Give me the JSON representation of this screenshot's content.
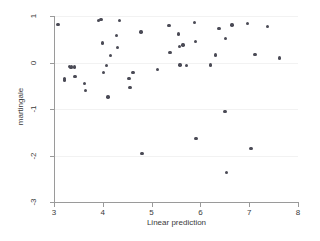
{
  "figure": {
    "background_color": "#ffffff",
    "marker_color": "#4a4a55",
    "axis_color": "#9a9a9a",
    "gridline_color": "#f2f2f2"
  },
  "chart_data": {
    "type": "scatter",
    "title": "",
    "xlabel": "Linear prediction",
    "ylabel": "martingale",
    "xlim": [
      3,
      8
    ],
    "ylim": [
      -3,
      1
    ],
    "xticks": [
      3,
      4,
      5,
      6,
      7,
      8
    ],
    "xticklabels": [
      "3",
      "4",
      "5",
      "6",
      "7",
      "8"
    ],
    "yticks": [
      1,
      0,
      -1,
      -2,
      -3
    ],
    "yticklabels": [
      "1",
      "0",
      "-1",
      "-2",
      "-3"
    ],
    "grid": "horizontal",
    "legend": "none",
    "series": [
      {
        "name": "martingale residuals",
        "marker": "filled-circle",
        "points": [
          [
            3.08,
            0.82
          ],
          [
            3.22,
            -0.34
          ],
          [
            3.22,
            -0.38
          ],
          [
            3.32,
            -0.08
          ],
          [
            3.35,
            -0.11
          ],
          [
            3.36,
            -0.09
          ],
          [
            3.42,
            -0.1
          ],
          [
            3.43,
            -0.3
          ],
          [
            3.63,
            -0.45
          ],
          [
            3.65,
            -0.6
          ],
          [
            3.91,
            0.9
          ],
          [
            3.96,
            0.93
          ],
          [
            3.99,
            0.42
          ],
          [
            4.02,
            -0.21
          ],
          [
            4.08,
            -0.07
          ],
          [
            4.11,
            -0.74
          ],
          [
            4.16,
            0.15
          ],
          [
            4.28,
            0.58
          ],
          [
            4.3,
            0.32
          ],
          [
            4.34,
            0.9
          ],
          [
            4.54,
            -0.35
          ],
          [
            4.56,
            -0.54
          ],
          [
            4.62,
            -0.21
          ],
          [
            4.78,
            0.66
          ],
          [
            4.8,
            -1.96
          ],
          [
            5.12,
            -0.15
          ],
          [
            5.36,
            0.79
          ],
          [
            5.38,
            0.22
          ],
          [
            5.55,
            0.61
          ],
          [
            5.57,
            0.34
          ],
          [
            5.58,
            -0.05
          ],
          [
            5.64,
            0.38
          ],
          [
            5.72,
            -0.06
          ],
          [
            5.88,
            0.86
          ],
          [
            5.9,
            0.45
          ],
          [
            5.91,
            -1.63
          ],
          [
            6.21,
            -0.05
          ],
          [
            6.31,
            0.16
          ],
          [
            6.38,
            0.73
          ],
          [
            6.5,
            -1.05
          ],
          [
            6.52,
            0.52
          ],
          [
            6.54,
            -2.36
          ],
          [
            6.65,
            0.81
          ],
          [
            6.97,
            0.84
          ],
          [
            7.04,
            -1.85
          ],
          [
            7.12,
            0.17
          ],
          [
            7.37,
            0.77
          ],
          [
            7.62,
            0.1
          ]
        ]
      }
    ]
  }
}
